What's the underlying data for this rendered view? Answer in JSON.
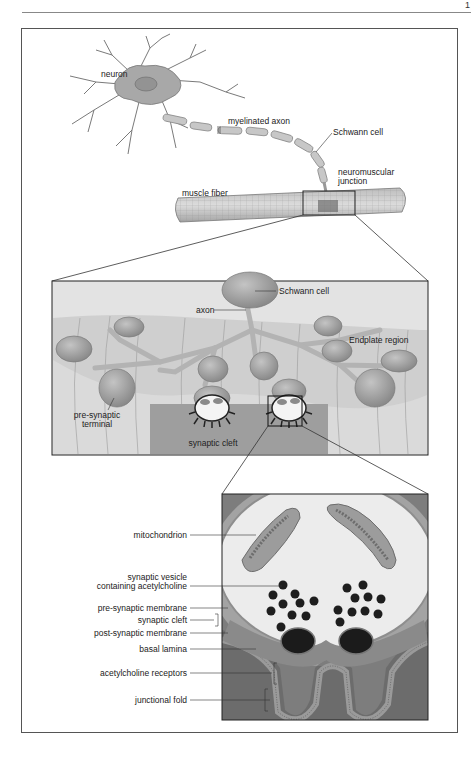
{
  "page": {
    "page_number": "1"
  },
  "figure": {
    "overview": {
      "labels": {
        "neuron": "neuron",
        "myelinated_axon": "myelinated axon",
        "schwann_cell": "Schwann cell",
        "nmj_line1": "neuromuscular",
        "nmj_line2": "junction",
        "muscle_fiber": "muscle fiber"
      }
    },
    "junction_detail": {
      "labels": {
        "schwann_cell": "Schwann cell",
        "axon": "axon",
        "endplate_region": "Endplate region",
        "presynaptic_line1": "pre-synaptic",
        "presynaptic_line2": "terminal",
        "synaptic_cleft": "synaptic cleft"
      }
    },
    "synapse_detail": {
      "labels": {
        "mitochondrion": "mitochondrion",
        "vesicle_line1": "synaptic vesicle",
        "vesicle_line2": "containing acetylcholine",
        "presynaptic_membrane": "pre-synaptic membrane",
        "synaptic_cleft": "synaptic cleft",
        "postsynaptic_membrane": "post-synaptic membrane",
        "basal_lamina": "basal lamina",
        "ach_receptors": "acetylcholine receptors",
        "junctional_fold": "junctional fold"
      }
    }
  }
}
